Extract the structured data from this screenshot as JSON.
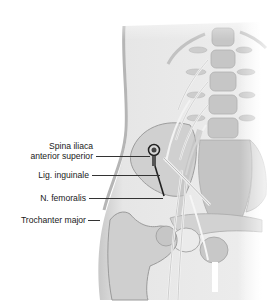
{
  "figure": {
    "labels": [
      {
        "id": "spina",
        "line1": "Spina iliaca",
        "line2": "anterior superior"
      },
      {
        "id": "lig",
        "text": "Lig. inguinale"
      },
      {
        "id": "nfem",
        "text": "N. femoralis"
      },
      {
        "id": "troch",
        "text": "Trochanter major"
      }
    ],
    "colors": {
      "skin": "#e9e9e9",
      "bone": "#cfcfcf",
      "bone_dark": "#a9a9a9",
      "nerve": "#f4f4f4",
      "needle": "#222222",
      "leader": "#333333"
    }
  }
}
